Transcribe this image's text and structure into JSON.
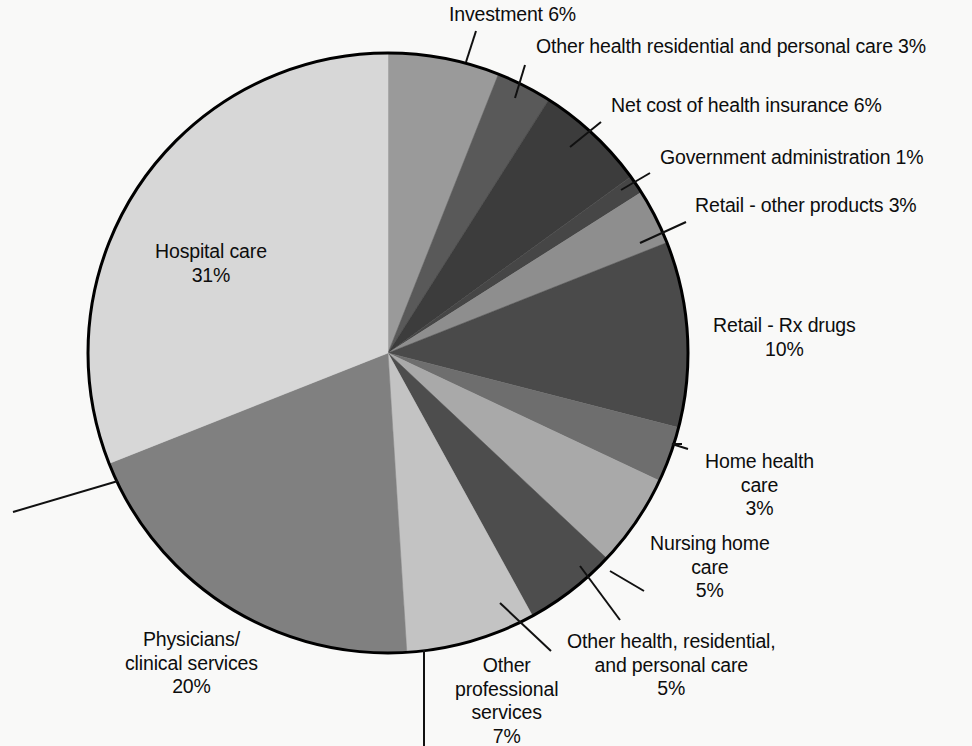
{
  "chart_data": {
    "type": "pie",
    "title": "",
    "subtitle": "",
    "xlabel": "",
    "ylabel": "",
    "units": "percent",
    "legend_position": "none",
    "grid": false,
    "total_percent": 100,
    "start_angle_deg": 0,
    "direction": "clockwise",
    "center": {
      "x": 388,
      "y": 353,
      "r": 300
    },
    "categories": [
      "Investment",
      "Other health residential and personal care",
      "Net cost of health insurance",
      "Government administration",
      "Retail - other products",
      "Retail - Rx drugs",
      "Home health care",
      "Nursing home care",
      "Other health, residential, and personal care",
      "Other professional services",
      "Physicians/clinical services",
      "Hospital care"
    ],
    "values": [
      6,
      3,
      6,
      1,
      3,
      10,
      3,
      5,
      5,
      7,
      20,
      31
    ],
    "value_labels": [
      "6%",
      "3%",
      "6%",
      "1%",
      "3%",
      "10%",
      "3%",
      "5%",
      "5%",
      "7%",
      "20%",
      "31%"
    ],
    "slice_colors": [
      "#9a9a9a",
      "#595959",
      "#3c3c3c",
      "#464646",
      "#8e8e8e",
      "#4a4a4a",
      "#6e6e6e",
      "#a9a9a9",
      "#4d4d4d",
      "#c3c3c3",
      "#808080",
      "#d7d7d7"
    ],
    "stroke_color": "#000000",
    "background_color": "#f9f9f8"
  },
  "labels": [
    {
      "id": "investment",
      "lines": [
        "Investment 6%"
      ],
      "align": "left",
      "x": 449,
      "y": 3,
      "leader": [
        [
          476,
          31
        ],
        [
          466,
          62
        ]
      ]
    },
    {
      "id": "other-health-residential-and-personal-care-top",
      "lines": [
        "Other health residential and personal care 3%"
      ],
      "align": "left",
      "x": 536,
      "y": 35,
      "leader": [
        [
          525,
          65
        ],
        [
          515,
          98
        ]
      ]
    },
    {
      "id": "net-cost-of-health-insurance",
      "lines": [
        "Net cost of health insurance 6%"
      ],
      "align": "left",
      "x": 611,
      "y": 94,
      "leader": [
        [
          601,
          122
        ],
        [
          570,
          147
        ]
      ]
    },
    {
      "id": "government-administration",
      "lines": [
        "Government administration 1%"
      ],
      "align": "left",
      "x": 660,
      "y": 146,
      "leader": [
        [
          650,
          173
        ],
        [
          621,
          190
        ]
      ]
    },
    {
      "id": "retail-other-products",
      "lines": [
        "Retail - other products 3%"
      ],
      "align": "left",
      "x": 695,
      "y": 194,
      "leader": [
        [
          686,
          222
        ],
        [
          640,
          243
        ]
      ]
    },
    {
      "id": "retail-rx-drugs",
      "lines": [
        "Retail - Rx drugs",
        "10%"
      ],
      "align": "center",
      "x": 713,
      "y": 314,
      "leader": null
    },
    {
      "id": "home-health-care",
      "lines": [
        "Home health",
        "care",
        "3%"
      ],
      "align": "center",
      "x": 705,
      "y": 450,
      "leader": [
        [
          682,
          444
        ],
        [
          672,
          444
        ],
        [
          688,
          449
        ]
      ]
    },
    {
      "id": "nursing-home-care",
      "lines": [
        "Nursing home",
        "care",
        "5%"
      ],
      "align": "center",
      "x": 650,
      "y": 532,
      "leader": [
        [
          644,
          591
        ],
        [
          610,
          571
        ]
      ]
    },
    {
      "id": "other-health-residential-and-personal-care-bottom",
      "lines": [
        "Other health, residential,",
        "and personal care",
        "5%"
      ],
      "align": "center",
      "x": 567,
      "y": 630,
      "leader": [
        [
          620,
          620
        ],
        [
          580,
          566
        ]
      ]
    },
    {
      "id": "other-professional-services",
      "lines": [
        "Other",
        "professional",
        "services",
        "7%"
      ],
      "align": "center",
      "x": 455,
      "y": 654,
      "leader": [
        [
          424,
          650
        ],
        [
          424,
          746
        ]
      ]
    },
    {
      "id": "physicians-clinical-services",
      "lines": [
        "Physicians/",
        "clinical services",
        "20%"
      ],
      "align": "center",
      "x": 125,
      "y": 628,
      "leader": null
    },
    {
      "id": "hospital-care",
      "lines": [
        "Hospital care",
        "31%"
      ],
      "align": "center",
      "x": 155,
      "y": 240,
      "leader": null
    }
  ],
  "extra_leaders": [
    {
      "id": "physicians-leader",
      "points": [
        [
          13,
          512
        ],
        [
          118,
          481
        ]
      ]
    },
    {
      "id": "other-professional-leader",
      "points": [
        [
          424,
          650
        ],
        [
          424,
          746
        ]
      ]
    },
    {
      "id": "other-health-bottom-leader",
      "points": [
        [
          551,
          651
        ],
        [
          500,
          603
        ]
      ]
    }
  ]
}
